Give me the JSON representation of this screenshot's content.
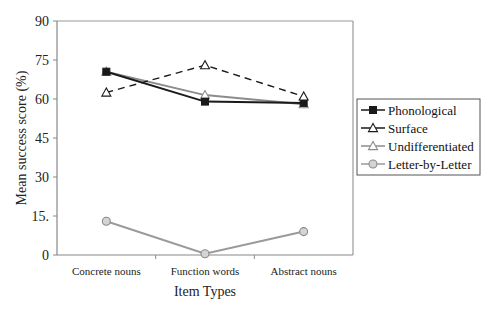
{
  "chart_data": {
    "type": "line",
    "title": "",
    "xlabel": "Item Types",
    "ylabel": "Mean success score (%)",
    "categories": [
      "Concrete nouns",
      "Function words",
      "Abstract nouns"
    ],
    "ylim": [
      0,
      90
    ],
    "yticks": [
      0,
      15,
      30,
      45,
      60,
      75,
      90
    ],
    "ytick_labels": [
      "0",
      "15.",
      "30",
      "45",
      "60",
      "75",
      "90"
    ],
    "grid": false,
    "legend_position": "right",
    "series": [
      {
        "name": "Phonological",
        "values": [
          70.5,
          59,
          58.5
        ],
        "color": "#1a1a1a",
        "marker": "square-filled",
        "line": "solid"
      },
      {
        "name": "Surface",
        "values": [
          62.5,
          73,
          61
        ],
        "color": "#1a1a1a",
        "marker": "triangle-open",
        "line": "dashed"
      },
      {
        "name": "Undifferentiated",
        "values": [
          70.5,
          61.5,
          58
        ],
        "color": "#8c8c8c",
        "marker": "triangle-open",
        "line": "solid"
      },
      {
        "name": "Letter-by-Letter",
        "values": [
          13,
          0.5,
          9
        ],
        "color": "#9a9a9a",
        "marker": "circle-filled-light",
        "line": "solid"
      }
    ]
  }
}
